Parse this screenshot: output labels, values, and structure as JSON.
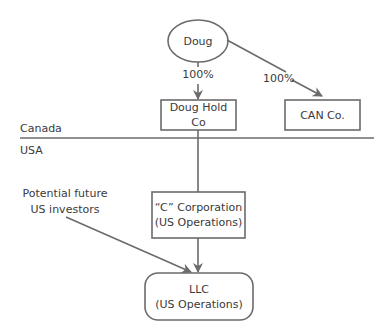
{
  "nodes": {
    "doug": {
      "label": "Doug"
    },
    "doug_hold_co": {
      "label": "Doug Hold Co"
    },
    "can_co": {
      "label": "CAN Co."
    },
    "c_corp": {
      "line1": "“C” Corporation",
      "line2": "(US Operations)"
    },
    "llc": {
      "line1": "LLC",
      "line2": "(US Operations)"
    }
  },
  "edges": {
    "doug_to_holdco": {
      "label": "100%"
    },
    "doug_to_canco": {
      "label": "100%"
    }
  },
  "regions": {
    "upper": "Canada",
    "lower": "USA"
  },
  "investors": {
    "line1": "Potential future",
    "line2": "US investors"
  },
  "colors": {
    "stroke": "#6b6b6b",
    "text": "#3a3a3a",
    "background": "#ffffff"
  }
}
